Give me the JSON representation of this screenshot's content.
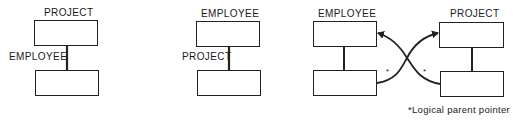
{
  "diagrams": [
    {
      "id": "hierarchy-project-parent",
      "parent_label": "PROJECT",
      "child_label": "EMPLOYEE"
    },
    {
      "id": "hierarchy-employee-parent",
      "parent_label": "EMPLOYEE",
      "child_label": "PROJECT"
    },
    {
      "id": "logical-relationship",
      "left_label": "EMPLOYEE",
      "right_label": "PROJECT",
      "pointer_marks": [
        "*",
        "*"
      ]
    }
  ],
  "footnote": "*Logical parent pointer",
  "colors": {
    "ink": "#222222",
    "background": "#ffffff"
  }
}
